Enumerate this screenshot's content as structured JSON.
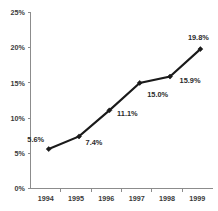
{
  "chart_data": {
    "type": "line",
    "title": "",
    "subtitle": "",
    "xlabel": "",
    "ylabel": "",
    "categories": [
      "1994",
      "1995",
      "1996",
      "1997",
      "1998",
      "1999"
    ],
    "values": [
      5.6,
      7.4,
      11.1,
      15.0,
      15.9,
      19.8
    ],
    "point_labels": [
      "5.6%",
      "7.4%",
      "11.1%",
      "15.0%",
      "15.9%",
      "19.8%"
    ],
    "series": [
      {
        "name": "",
        "values": [
          5.6,
          7.4,
          11.1,
          15.0,
          15.9,
          19.8
        ]
      }
    ],
    "ylim": [
      0,
      25
    ],
    "ytick_values": [
      0,
      5,
      10,
      15,
      20,
      25
    ],
    "ytick_labels": [
      "0%",
      "5%",
      "10%",
      "15%",
      "20%",
      "25%"
    ],
    "xtick_labels": [
      "1994",
      "1995",
      "1996",
      "1997",
      "1998",
      "1999"
    ],
    "grid": false,
    "legend": false,
    "legend_position": "none",
    "marker": "diamond",
    "line_color": "#1a1a1a",
    "axis_color": "#8c8c8c",
    "label_color": "#2b2b2b",
    "background_color": "#ffffff",
    "label_offsets": [
      {
        "dx": -13,
        "dy": -7
      },
      {
        "dx": 15,
        "dy": 9
      },
      {
        "dx": 18,
        "dy": 6
      },
      {
        "dx": 18,
        "dy": 14
      },
      {
        "dx": 20,
        "dy": 6
      },
      {
        "dx": -2,
        "dy": -9
      }
    ]
  }
}
